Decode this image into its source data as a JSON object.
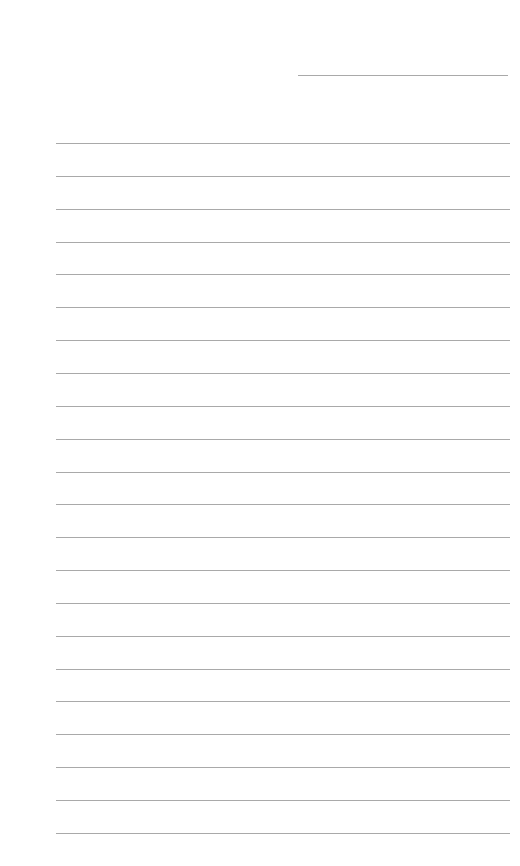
{
  "page": {
    "type": "lined-paper",
    "background_color": "#ffffff",
    "line_color": "#a9a9a9",
    "header_line": {
      "x_start": 298,
      "x_end": 508,
      "y": 75
    },
    "body_lines": {
      "count": 22,
      "x_start": 56,
      "x_end": 510,
      "y_first": 143,
      "spacing": 32.85
    }
  }
}
